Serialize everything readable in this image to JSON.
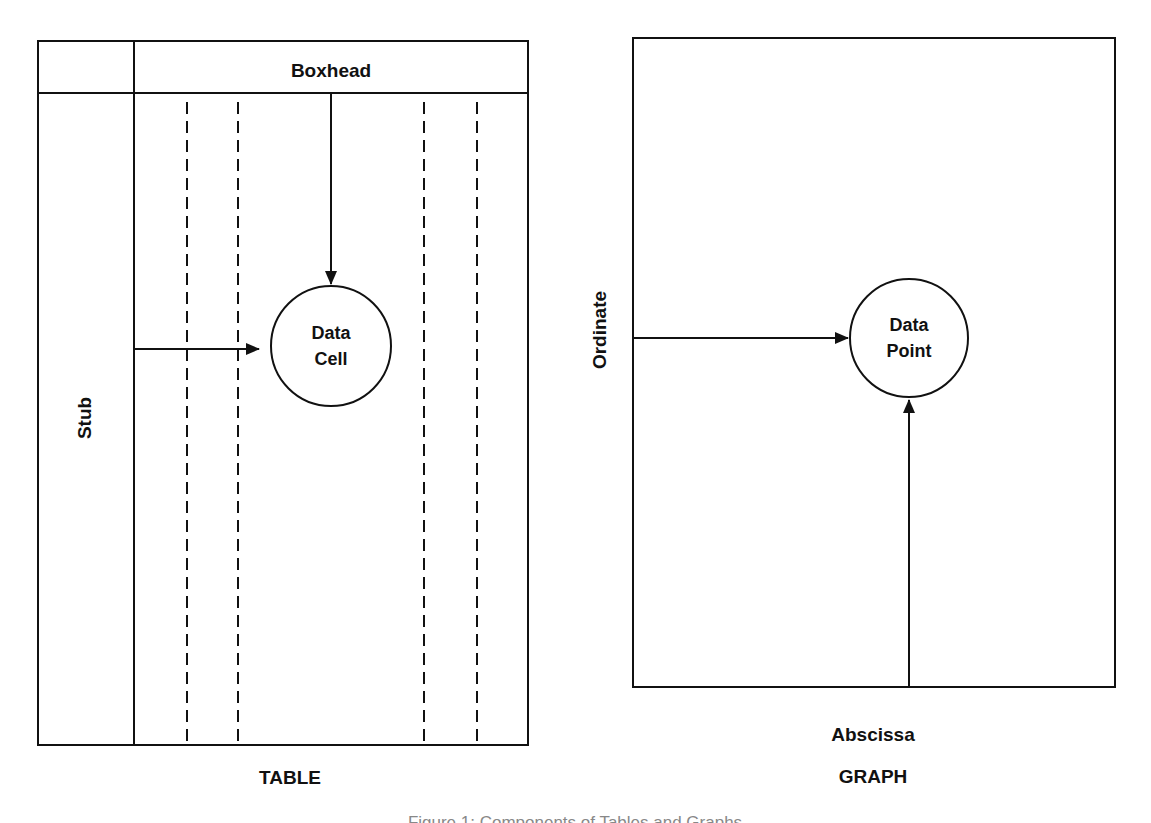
{
  "table_diagram": {
    "boxhead_label": "Boxhead",
    "stub_label": "Stub",
    "data_cell": {
      "line1": "Data",
      "line2": "Cell"
    },
    "caption": "TABLE"
  },
  "graph_diagram": {
    "ordinate_label": "Ordinate",
    "abscissa_label": "Abscissa",
    "data_point": {
      "line1": "Data",
      "line2": "Point"
    },
    "caption": "GRAPH"
  },
  "figure_caption": "Figure 1: Components of Tables and Graphs",
  "colors": {
    "line": "#111111",
    "background": "#ffffff"
  }
}
